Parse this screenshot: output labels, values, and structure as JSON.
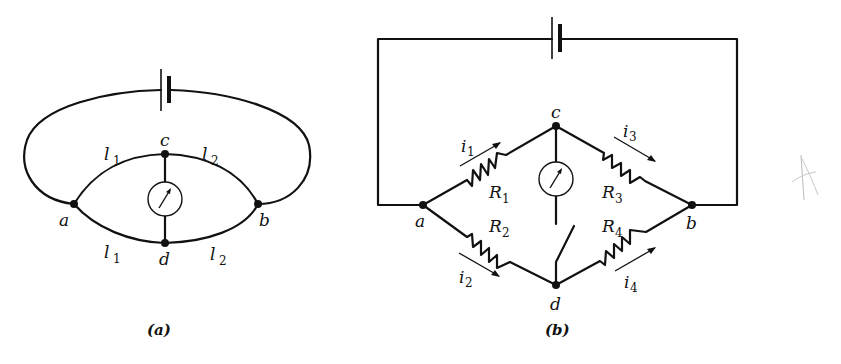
{
  "figure_a": {
    "caption": "(a)",
    "nodes": {
      "a": "a",
      "b": "b",
      "c": "c",
      "d": "d"
    },
    "segments": [
      {
        "label": "l",
        "sub": "1",
        "position": "a-c"
      },
      {
        "label": "l",
        "sub": "2",
        "position": "c-b"
      },
      {
        "label": "l",
        "sub": "1",
        "position": "a-d"
      },
      {
        "label": "l",
        "sub": "2",
        "position": "d-b"
      }
    ],
    "components": [
      "battery",
      "galvanometer"
    ]
  },
  "figure_b": {
    "caption": "(b)",
    "nodes": {
      "a": "a",
      "b": "b",
      "c": "c",
      "d": "d"
    },
    "resistors": [
      {
        "label": "R",
        "sub": "1",
        "branch": "a-c"
      },
      {
        "label": "R",
        "sub": "2",
        "branch": "a-d"
      },
      {
        "label": "R",
        "sub": "3",
        "branch": "c-b"
      },
      {
        "label": "R",
        "sub": "4",
        "branch": "d-b"
      }
    ],
    "currents": [
      {
        "label": "i",
        "sub": "1",
        "branch": "a-c"
      },
      {
        "label": "i",
        "sub": "2",
        "branch": "a-d"
      },
      {
        "label": "i",
        "sub": "3",
        "branch": "c-b"
      },
      {
        "label": "i",
        "sub": "4",
        "branch": "d-b"
      }
    ],
    "components": [
      "battery",
      "galvanometer",
      "switch"
    ]
  },
  "annotation": {
    "mark": "pencil-scribble"
  }
}
